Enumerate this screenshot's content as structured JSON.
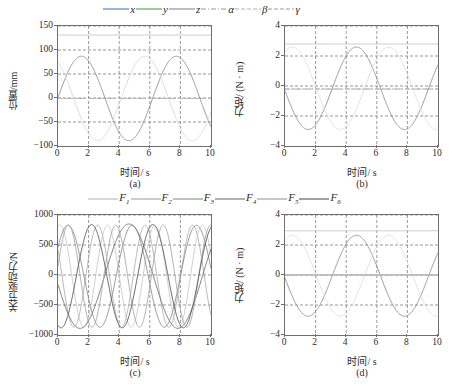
{
  "figure": {
    "legend_top": [
      {
        "label": "x",
        "color": "#3f7fbf",
        "style": "solid"
      },
      {
        "label": "y",
        "color": "#4aa64a",
        "style": "solid"
      },
      {
        "label": "z",
        "color": "#888888",
        "style": "solid"
      },
      {
        "label": "α",
        "color": "#9a9a9a",
        "style": "dashdot"
      },
      {
        "label": "β",
        "color": "#b0b0b0",
        "style": "dashed"
      },
      {
        "label": "γ",
        "color": "#9a9a9a",
        "style": "dashed"
      }
    ],
    "legend_bottom": [
      {
        "label": "F",
        "sub": "1",
        "color": "#b9b9b9",
        "style": "solid"
      },
      {
        "label": "F",
        "sub": "2",
        "color": "#a3a3a3",
        "style": "solid"
      },
      {
        "label": "F",
        "sub": "3",
        "color": "#8d8d8d",
        "style": "solid"
      },
      {
        "label": "F",
        "sub": "4",
        "color": "#6f6f6f",
        "style": "solid"
      },
      {
        "label": "F",
        "sub": "5",
        "color": "#9c9c9c",
        "style": "solid"
      },
      {
        "label": "F",
        "sub": "6",
        "color": "#545454",
        "style": "solid"
      }
    ],
    "captions": {
      "a": "(a)",
      "b": "(b)",
      "c": "(c)",
      "d": "(d)"
    },
    "xlabel": "时间/ s"
  },
  "chart_data": [
    {
      "id": "a",
      "type": "line",
      "title": "",
      "xlabel": "时间/ s",
      "ylabel": "位置/mm",
      "xlim": [
        0,
        10
      ],
      "ylim": [
        -100,
        150
      ],
      "xticks": [
        0,
        2,
        4,
        6,
        8,
        10
      ],
      "yticks": [
        -100,
        -50,
        0,
        50,
        100,
        150
      ],
      "grid": true,
      "legend_position": "above-figure",
      "series": [
        {
          "name": "x",
          "color": "#8f8f8f",
          "style": "solid",
          "form": "sine",
          "amplitude": 88,
          "offset": -1,
          "period": 6.2,
          "phase": 0.02,
          "values": [
            0,
            52,
            84,
            87,
            60,
            14,
            -38,
            -76,
            -90,
            -78,
            -44,
            2,
            47,
            80,
            88,
            66,
            22,
            -31,
            -71,
            -89,
            -48
          ]
        },
        {
          "name": "y",
          "color": "#d8d8d8",
          "style": "solid",
          "form": "sine",
          "amplitude": 88,
          "offset": -1,
          "period": 6.2,
          "phase": 2.1,
          "values": [
            86,
            88,
            62,
            18,
            -30,
            -71,
            -89,
            -80,
            -48,
            -2,
            44,
            79,
            89,
            68,
            26,
            -26,
            -68,
            -88,
            -83,
            -52,
            86
          ]
        },
        {
          "name": "z",
          "color": "#c4c4c4",
          "style": "solid",
          "form": "constant",
          "value": 131,
          "values": [
            131,
            131,
            131,
            131,
            131,
            131,
            131,
            131,
            131,
            131,
            131,
            131,
            131,
            131,
            131,
            131,
            131,
            131,
            131,
            131,
            131
          ]
        },
        {
          "name": "α",
          "color": "#9a9a9a",
          "style": "dashdot",
          "form": "constant",
          "value": -1,
          "values": [
            -1,
            -1,
            -1,
            -1,
            -1,
            -1,
            -1,
            -1,
            -1,
            -1,
            -1,
            -1,
            -1,
            -1,
            -1,
            -1,
            -1,
            -1,
            -1,
            -1,
            -1
          ]
        },
        {
          "name": "β",
          "color": "#c9c9c9",
          "style": "dashed",
          "form": "constant",
          "value": -1,
          "values": [
            -1,
            -1,
            -1,
            -1,
            -1,
            -1,
            -1,
            -1,
            -1,
            -1,
            -1,
            -1,
            -1,
            -1,
            -1,
            -1,
            -1,
            -1,
            -1,
            -1,
            -1
          ]
        },
        {
          "name": "γ",
          "color": "#bdbdbd",
          "style": "dashed",
          "form": "constant",
          "value": -1,
          "values": [
            -1,
            -1,
            -1,
            -1,
            -1,
            -1,
            -1,
            -1,
            -1,
            -1,
            -1,
            -1,
            -1,
            -1,
            -1,
            -1,
            -1,
            -1,
            -1,
            -1,
            -1
          ]
        }
      ]
    },
    {
      "id": "b",
      "type": "line",
      "title": "",
      "xlabel": "时间/ s",
      "ylabel": "力矩/ (N · m)",
      "xlim": [
        0,
        10
      ],
      "ylim": [
        -4,
        4
      ],
      "xticks": [
        0,
        2,
        4,
        6,
        8,
        10
      ],
      "yticks": [
        -4,
        -2,
        0,
        2,
        4
      ],
      "grid": true,
      "legend_position": "above-figure",
      "series": [
        {
          "name": "x",
          "color": "#8f8f8f",
          "style": "solid",
          "form": "sine",
          "amplitude": 2.75,
          "offset": -0.15,
          "period": 6.3,
          "phase": 3.2,
          "values": [
            -0.45,
            -1.6,
            -2.4,
            -2.8,
            -2.6,
            -1.9,
            -0.8,
            0.45,
            1.6,
            2.4,
            2.65,
            2.3,
            1.5,
            0.4,
            -0.8,
            -1.9,
            -2.6,
            -2.85,
            -2.5,
            -1.6,
            0.8
          ]
        },
        {
          "name": "y",
          "color": "#dcdcdc",
          "style": "solid",
          "form": "sine",
          "amplitude": 2.75,
          "offset": -0.15,
          "period": 6.3,
          "phase": 1.1,
          "values": [
            2.0,
            2.7,
            2.55,
            1.8,
            0.7,
            -0.6,
            -1.8,
            -2.6,
            -2.8,
            -2.3,
            -1.4,
            -0.2,
            1.1,
            2.1,
            2.7,
            2.5,
            1.7,
            0.5,
            -0.8,
            -1.9,
            2.0
          ]
        },
        {
          "name": "z",
          "color": "#c4c4c4",
          "style": "solid",
          "form": "constant",
          "value": 2.8,
          "values": [
            2.8,
            2.8,
            2.8,
            2.8,
            2.8,
            2.8,
            2.8,
            2.8,
            2.8,
            2.8,
            2.8,
            2.8,
            2.8,
            2.8,
            2.8,
            2.8,
            2.8,
            2.8,
            2.8,
            2.8,
            2.8
          ]
        },
        {
          "name": "α",
          "color": "#9a9a9a",
          "style": "dashdot",
          "form": "constant",
          "value": -0.2,
          "values": [
            -0.2,
            -0.2,
            -0.2,
            -0.2,
            -0.2,
            -0.2,
            -0.2,
            -0.2,
            -0.2,
            -0.2,
            -0.2,
            -0.2,
            -0.2,
            -0.2,
            -0.2,
            -0.2,
            -0.2,
            -0.2,
            -0.2,
            -0.2,
            -0.2
          ]
        },
        {
          "name": "β",
          "color": "#cccccc",
          "style": "dashed",
          "form": "constant",
          "value": -0.2,
          "values": [
            -0.2,
            -0.2,
            -0.2,
            -0.2,
            -0.2,
            -0.2,
            -0.2,
            -0.2,
            -0.2,
            -0.2,
            -0.2,
            -0.2,
            -0.2,
            -0.2,
            -0.2,
            -0.2,
            -0.2,
            -0.2,
            -0.2,
            -0.2,
            -0.2
          ]
        },
        {
          "name": "γ",
          "color": "#bdbdbd",
          "style": "dashed",
          "form": "constant",
          "value": -0.2,
          "values": [
            -0.2,
            -0.2,
            -0.2,
            -0.2,
            -0.2,
            -0.2,
            -0.2,
            -0.2,
            -0.2,
            -0.2,
            -0.2,
            -0.2,
            -0.2,
            -0.2,
            -0.2,
            -0.2,
            -0.2,
            -0.2,
            -0.2,
            -0.2,
            -0.2
          ]
        }
      ]
    },
    {
      "id": "c",
      "type": "line",
      "title": "",
      "xlabel": "时间/ s",
      "ylabel": "关节驱动力/N",
      "xlim": [
        0,
        10
      ],
      "ylim": [
        -1000,
        1000
      ],
      "xticks": [
        0,
        2,
        4,
        6,
        8,
        10
      ],
      "yticks": [
        -1000,
        -500,
        0,
        500,
        1000
      ],
      "grid": true,
      "legend_position": "above-axes",
      "series": [
        {
          "name": "F1",
          "color": "#c9c9c9",
          "style": "solid",
          "form": "sine",
          "amplitude": 850,
          "offset": -20,
          "period": 3.1,
          "phase": 1.3,
          "values": [
            800,
            520,
            -80,
            -660,
            -870,
            -600,
            -40,
            560,
            850,
            640,
            60,
            -520,
            -860,
            -680,
            -120,
            470,
            840,
            700,
            180,
            -420,
            -830
          ]
        },
        {
          "name": "F2",
          "color": "#b0b0b0",
          "style": "solid",
          "form": "sine",
          "amplitude": 850,
          "offset": -20,
          "period": 3.1,
          "phase": 2.6,
          "values": [
            -120,
            -700,
            -880,
            -540,
            60,
            640,
            860,
            560,
            -60,
            -640,
            -870,
            -560,
            40,
            620,
            870,
            600,
            0,
            -580,
            -860,
            -620,
            -40
          ]
        },
        {
          "name": "F3",
          "color": "#8d8d8d",
          "style": "solid",
          "form": "sine",
          "amplitude": 850,
          "offset": -20,
          "period": 4.2,
          "phase": 0.6,
          "values": [
            450,
            810,
            840,
            500,
            -40,
            -560,
            -860,
            -790,
            -390,
            160,
            660,
            870,
            730,
            300,
            -270,
            -720,
            -870,
            -660,
            -180,
            380,
            790
          ]
        },
        {
          "name": "F4",
          "color": "#6f6f6f",
          "style": "solid",
          "form": "sine",
          "amplitude": 870,
          "offset": -20,
          "period": 6.4,
          "phase": 3.3,
          "values": [
            130,
            -380,
            -770,
            -870,
            -680,
            -260,
            270,
            700,
            870,
            760,
            390,
            -120,
            -600,
            -850,
            -820,
            -500,
            -20,
            480,
            800,
            860,
            250
          ]
        },
        {
          "name": "F5",
          "color": "#a8a8a8",
          "style": "solid",
          "form": "sine",
          "amplitude": 850,
          "offset": -20,
          "period": 3.1,
          "phase": 0.2,
          "values": [
            150,
            720,
            870,
            520,
            -100,
            -680,
            -870,
            -520,
            100,
            660,
            870,
            540,
            -60,
            -640,
            -870,
            -560,
            60,
            620,
            860,
            580,
            20
          ]
        },
        {
          "name": "F6",
          "color": "#5a5a5a",
          "style": "solid",
          "form": "sine",
          "amplitude": 860,
          "offset": -20,
          "period": 4.0,
          "phase": 4.4,
          "values": [
            -830,
            -640,
            -140,
            420,
            820,
            830,
            450,
            -130,
            -650,
            -860,
            -620,
            -80,
            470,
            830,
            810,
            400,
            -190,
            -690,
            -860,
            -580,
            -30
          ]
        }
      ]
    },
    {
      "id": "d",
      "type": "line",
      "title": "",
      "xlabel": "时间/ s",
      "ylabel": "力矩/ (N · m)",
      "xlim": [
        0,
        10
      ],
      "ylim": [
        -4,
        4
      ],
      "xticks": [
        0,
        2,
        4,
        6,
        8,
        10
      ],
      "yticks": [
        -4,
        -2,
        0,
        2,
        4
      ],
      "grid": true,
      "legend_position": "above-axes",
      "series": [
        {
          "name": "F1",
          "color": "#8f8f8f",
          "style": "solid",
          "form": "sine",
          "amplitude": 2.7,
          "offset": -0.05,
          "period": 6.3,
          "phase": 3.2,
          "values": [
            -0.1,
            -1.4,
            -2.3,
            -2.7,
            -2.55,
            -1.85,
            -0.7,
            0.55,
            1.7,
            2.45,
            2.6,
            2.25,
            1.4,
            0.3,
            -0.9,
            -1.95,
            -2.6,
            -2.8,
            -2.45,
            -1.5,
            0.85
          ]
        },
        {
          "name": "F2",
          "color": "#dcdcdc",
          "style": "solid",
          "form": "sine",
          "amplitude": 2.7,
          "offset": -0.05,
          "period": 6.3,
          "phase": 1.1,
          "values": [
            2.1,
            2.65,
            2.5,
            1.75,
            0.65,
            -0.65,
            -1.85,
            -2.6,
            -2.75,
            -2.25,
            -1.35,
            -0.15,
            1.15,
            2.15,
            2.65,
            2.45,
            1.65,
            0.45,
            -0.85,
            -1.95,
            2.05
          ]
        },
        {
          "name": "F3",
          "color": "#c4c4c4",
          "style": "solid",
          "form": "constant",
          "value": 2.95,
          "values": [
            2.95,
            2.95,
            2.95,
            2.95,
            2.95,
            2.95,
            2.95,
            2.95,
            2.95,
            2.95,
            2.95,
            2.95,
            2.95,
            2.95,
            2.95,
            2.95,
            2.95,
            2.95,
            2.95,
            2.95,
            2.95
          ]
        },
        {
          "name": "F4",
          "color": "#8a8a8a",
          "style": "solid",
          "form": "constant",
          "value": 0,
          "values": [
            0,
            0,
            0,
            0,
            0,
            0,
            0,
            0,
            0,
            0,
            0,
            0,
            0,
            0,
            0,
            0,
            0,
            0,
            0,
            0,
            0
          ]
        },
        {
          "name": "F5",
          "color": "#cccccc",
          "style": "solid",
          "form": "constant",
          "value": 0,
          "values": [
            0,
            0,
            0,
            0,
            0,
            0,
            0,
            0,
            0,
            0,
            0,
            0,
            0,
            0,
            0,
            0,
            0,
            0,
            0,
            0,
            0
          ]
        },
        {
          "name": "F6",
          "color": "#bdbdbd",
          "style": "solid",
          "form": "constant",
          "value": 0,
          "values": [
            0,
            0,
            0,
            0,
            0,
            0,
            0,
            0,
            0,
            0,
            0,
            0,
            0,
            0,
            0,
            0,
            0,
            0,
            0,
            0,
            0
          ]
        }
      ]
    }
  ]
}
